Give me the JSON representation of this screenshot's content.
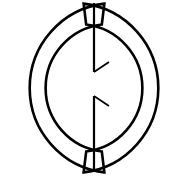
{
  "figure": {
    "canvas": {
      "width": 187,
      "height": 178,
      "background_color": "#ffffff"
    },
    "stroke_color": "#000000",
    "geometry": {
      "center_x": 94,
      "center_y": 88,
      "outer_radius": 85,
      "inner_radius": 64,
      "band_thickness": 21,
      "stroke_width": 2.6
    },
    "parts": [
      {
        "name": "left-ring-band",
        "description": "Left C-shaped crescent band outline",
        "start_angle_deg": 97,
        "end_angle_deg": 263,
        "outline_path": "M 86.6 3.6 A 85 85 0 1 0 86.6 172.4 L 87.4 151.6 A 64 64 0 1 1 87.4 24.4 Z"
      },
      {
        "name": "right-ring-band",
        "description": "Right C-shaped crescent band outline, mirror of left",
        "start_angle_deg": 83,
        "end_angle_deg": -83,
        "outline_path": "M 101.4 3.6 A 85 85 0 1 1 101.4 172.4 L 100.6 151.6 A 64 64 0 1 0 100.6 24.4 Z"
      },
      {
        "name": "center-line-upper",
        "description": "Upper segment of vertical centerline",
        "x": 94,
        "y_start": 3,
        "y_end": 72
      },
      {
        "name": "center-line-lower",
        "description": "Lower segment of vertical centerline",
        "x": 94,
        "y_start": 96,
        "y_end": 169
      },
      {
        "name": "upper-break-tick",
        "description": "Diagonal break tick pointing up-right from upper centerline end",
        "x1": 94,
        "y1": 72,
        "x2": 109,
        "y2": 62
      },
      {
        "name": "lower-break-tick",
        "description": "Diagonal break tick pointing down-right from lower centerline start",
        "x1": 94,
        "y1": 96,
        "x2": 109,
        "y2": 106
      }
    ]
  }
}
